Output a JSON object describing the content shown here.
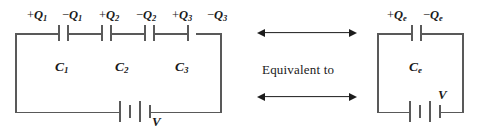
{
  "figure": {
    "kind": "circuit-diagram",
    "middle_text": "Equivalent to",
    "line_color": "#595959",
    "arrow_color": "#1c1c1c",
    "background": "#ffffff"
  },
  "series_circuit": {
    "name": "series-capacitor-circuit",
    "charge_labels": [
      {
        "sign": "+",
        "symbol": "Q",
        "sub": "1",
        "text": "+Q1"
      },
      {
        "sign": "−",
        "symbol": "Q",
        "sub": "1",
        "text": "−Q1"
      },
      {
        "sign": "+",
        "symbol": "Q",
        "sub": "2",
        "text": "+Q2"
      },
      {
        "sign": "−",
        "symbol": "Q",
        "sub": "2",
        "text": "−Q2"
      },
      {
        "sign": "+",
        "symbol": "Q",
        "sub": "3",
        "text": "+Q3"
      },
      {
        "sign": "−",
        "symbol": "Q",
        "sub": "3",
        "text": "−Q3"
      }
    ],
    "capacitors": [
      {
        "symbol": "C",
        "sub": "1",
        "text": "C1"
      },
      {
        "symbol": "C",
        "sub": "2",
        "text": "C2"
      },
      {
        "symbol": "C",
        "sub": "3",
        "text": "C3"
      }
    ],
    "battery_label": "V"
  },
  "equivalent_circuit": {
    "name": "equivalent-capacitor-circuit",
    "charge_labels": [
      {
        "sign": "+",
        "symbol": "Q",
        "sub": "e",
        "text": "+Qe"
      },
      {
        "sign": "−",
        "symbol": "Q",
        "sub": "e",
        "text": "−Qe"
      }
    ],
    "capacitor": {
      "symbol": "C",
      "sub": "e",
      "text": "Ce"
    },
    "battery_label": "V"
  }
}
